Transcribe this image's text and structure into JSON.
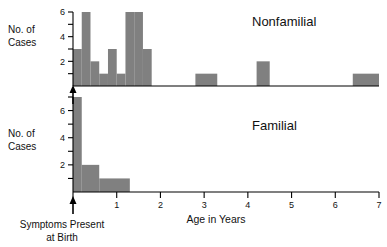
{
  "chart_data": {
    "type": "bar",
    "title": "",
    "subtitle": "",
    "xlabel": "Age in Years",
    "ylabel": "No. of Cases",
    "xlim": [
      0,
      7
    ],
    "grid": false,
    "legend": "none",
    "annotations": [
      {
        "name": "symptoms-present-at-birth",
        "line1": "Symptoms Present",
        "line2": "at Birth",
        "x": 0.0
      }
    ],
    "panels": [
      {
        "name": "nonfamilial",
        "label": "Nonfamilial",
        "ylabel": "No. of Cases",
        "ylim": [
          0,
          6
        ],
        "ytick_values": [
          1,
          2,
          3,
          4,
          5,
          6
        ],
        "ytick_labels": [
          "",
          "2",
          "",
          "4",
          "",
          "6"
        ],
        "bin_width": 0.2,
        "bars": [
          {
            "x0": 0.0,
            "x1": 0.2,
            "value": 3
          },
          {
            "x0": 0.2,
            "x1": 0.4,
            "value": 6
          },
          {
            "x0": 0.4,
            "x1": 0.6,
            "value": 2
          },
          {
            "x0": 0.6,
            "x1": 0.8,
            "value": 1
          },
          {
            "x0": 0.8,
            "x1": 1.0,
            "value": 3
          },
          {
            "x0": 1.0,
            "x1": 1.2,
            "value": 1
          },
          {
            "x0": 1.2,
            "x1": 1.4,
            "value": 6
          },
          {
            "x0": 1.4,
            "x1": 1.6,
            "value": 6
          },
          {
            "x0": 1.6,
            "x1": 1.8,
            "value": 3
          },
          {
            "x0": 2.8,
            "x1": 3.3,
            "value": 1
          },
          {
            "x0": 4.2,
            "x1": 4.5,
            "value": 2
          },
          {
            "x0": 6.4,
            "x1": 7.0,
            "value": 1
          }
        ]
      },
      {
        "name": "familial",
        "label": "Familial",
        "ylabel": "No. of Cases",
        "ylim": [
          0,
          7
        ],
        "ytick_values": [
          1,
          2,
          3,
          4,
          5,
          6,
          7
        ],
        "ytick_labels": [
          "",
          "2",
          "",
          "4",
          "",
          "6",
          ""
        ],
        "bin_width": 0.2,
        "bars": [
          {
            "x0": 0.0,
            "x1": 0.2,
            "value": 7
          },
          {
            "x0": 0.2,
            "x1": 0.6,
            "value": 2
          },
          {
            "x0": 0.6,
            "x1": 1.3,
            "value": 1
          }
        ]
      }
    ],
    "xtick_values": [
      0,
      1,
      2,
      3,
      4,
      5,
      6,
      7
    ],
    "xtick_labels": [
      "",
      "1",
      "2",
      "3",
      "4",
      "5",
      "6",
      "7"
    ]
  }
}
